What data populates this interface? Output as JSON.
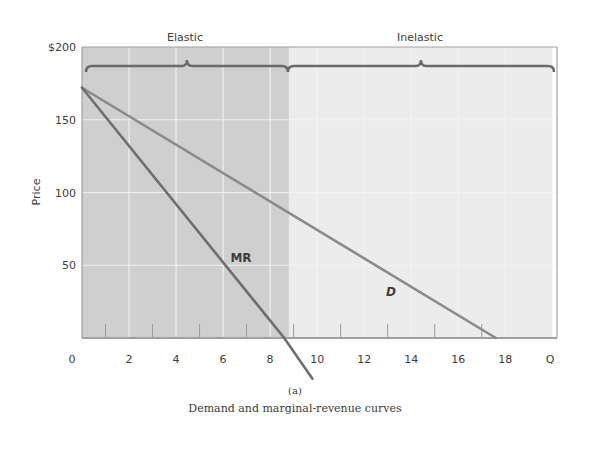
{
  "chart_data": {
    "type": "line",
    "title": "Demand and marginal-revenue curves",
    "panel_label": "(a)",
    "xlabel": "Q",
    "ylabel": "Price",
    "xlim": [
      0,
      20
    ],
    "ylim": [
      0,
      200
    ],
    "x_ticks": [
      "0",
      "2",
      "4",
      "6",
      "8",
      "10",
      "12",
      "14",
      "16",
      "18",
      "Q"
    ],
    "x_tick_values": [
      0,
      2,
      4,
      6,
      8,
      10,
      12,
      14,
      16,
      18,
      20
    ],
    "x_minor_ticks": [
      1,
      3,
      5,
      7,
      9,
      11,
      13,
      15,
      17
    ],
    "y_ticks": [
      "$200",
      "150",
      "100",
      "50"
    ],
    "y_tick_values": [
      200,
      150,
      100,
      50
    ],
    "grid": true,
    "series": [
      {
        "name": "D",
        "label": "D",
        "points": [
          [
            0,
            172
          ],
          [
            17.6,
            0
          ]
        ],
        "color": "#8a8a8a"
      },
      {
        "name": "MR",
        "label": "MR",
        "points": [
          [
            0,
            172
          ],
          [
            8.6,
            0
          ],
          [
            9.8,
            -28
          ]
        ],
        "color": "#6e6e6e"
      }
    ],
    "regions": [
      {
        "name": "Elastic",
        "label": "Elastic",
        "x_range": [
          0,
          8.8
        ],
        "fill": "#cfcfcf"
      },
      {
        "name": "Inelastic",
        "label": "Inelastic",
        "x_range": [
          8.8,
          20
        ],
        "fill": "#ececec"
      }
    ],
    "annotations": [
      {
        "text": "MR",
        "x": 6.8,
        "y": 56
      },
      {
        "text": "D",
        "x": 13.0,
        "y": 34
      }
    ]
  },
  "labels": {
    "elastic": "Elastic",
    "inelastic": "Inelastic",
    "price_axis": "Price",
    "mr_label": "MR",
    "d_label": "D",
    "panel": "(a)",
    "caption": "Demand and marginal-revenue curves"
  },
  "colors": {
    "elastic_fill": "#cfcfcf",
    "inelastic_fill": "#ececec",
    "brace": "#6a6a6a",
    "axis": "#a0a0a0",
    "grid": "#f4f4f4"
  }
}
